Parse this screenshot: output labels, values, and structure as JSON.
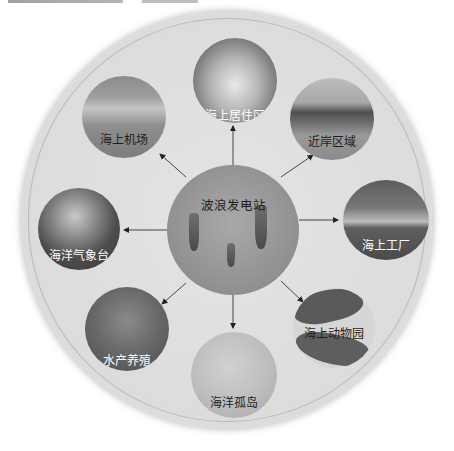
{
  "diagram": {
    "type": "hub-and-spoke",
    "center": {
      "label": "波浪发电站"
    },
    "nodes": [
      {
        "id": "top",
        "label": "海上居住区"
      },
      {
        "id": "top-left",
        "label": "海上机场"
      },
      {
        "id": "top-right",
        "label": "近岸区域"
      },
      {
        "id": "left",
        "label": "海洋气象台"
      },
      {
        "id": "right",
        "label": "海上工厂"
      },
      {
        "id": "bottom-left",
        "label": "水产养殖"
      },
      {
        "id": "bottom",
        "label": "海洋孤岛"
      },
      {
        "id": "bottom-right",
        "label": "海上动物园"
      }
    ],
    "edges": [
      {
        "from": "波浪发电站",
        "to": "海上居住区"
      },
      {
        "from": "波浪发电站",
        "to": "海上机场"
      },
      {
        "from": "波浪发电站",
        "to": "近岸区域"
      },
      {
        "from": "波浪发电站",
        "to": "海洋气象台"
      },
      {
        "from": "波浪发电站",
        "to": "海上工厂"
      },
      {
        "from": "波浪发电站",
        "to": "水产养殖"
      },
      {
        "from": "波浪发电站",
        "to": "海洋孤岛"
      },
      {
        "from": "波浪发电站",
        "to": "海上动物园"
      }
    ]
  }
}
